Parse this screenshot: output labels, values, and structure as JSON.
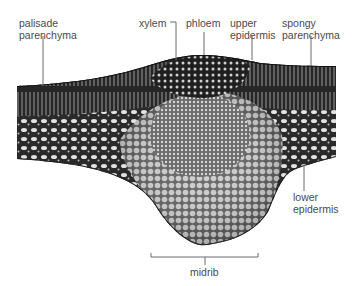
{
  "figure": {
    "colors": {
      "background": "#ffffff",
      "tissue_dark": "#1e1e1e",
      "tissue_mid": "#6e6e6e",
      "tissue_light": "#d8d8d8",
      "label_text": "#4a4a4a",
      "leader_line": "#6b6b6b"
    }
  },
  "labels": {
    "palisade_parenchyma": "palisade\nparenchyma",
    "xylem": "xylem",
    "phloem": "phloem",
    "upper_epidermis": "upper\nepidermis",
    "spongy_parenchyma": "spongy\nparenchyma",
    "lower_epidermis": "lower\nepidermis",
    "midrib": "midrib"
  }
}
